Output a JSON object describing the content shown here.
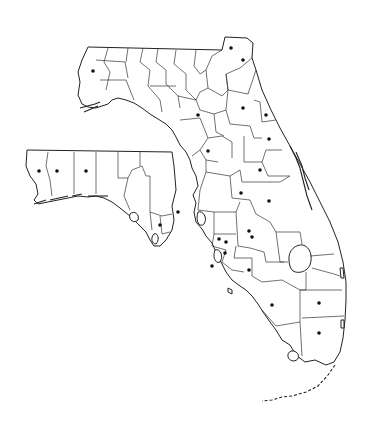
{
  "map": {
    "subject": "Florida county outline map",
    "inset": "Western panhandle inset",
    "line_color": "#222222",
    "background": "#ffffff",
    "marker_color": "#111111",
    "markers_main": [
      [
        93,
        71
      ],
      [
        231,
        48
      ],
      [
        243,
        60
      ],
      [
        198,
        115
      ],
      [
        243,
        108
      ],
      [
        266,
        115
      ],
      [
        208,
        151
      ],
      [
        269,
        139
      ],
      [
        260,
        170
      ],
      [
        241,
        193
      ],
      [
        269,
        201
      ],
      [
        249,
        231
      ],
      [
        226,
        242
      ],
      [
        219,
        239
      ],
      [
        252,
        237
      ],
      [
        225,
        253
      ],
      [
        249,
        270
      ],
      [
        212,
        266
      ],
      [
        272,
        305
      ],
      [
        319,
        303
      ],
      [
        319,
        333
      ],
      [
        178,
        212
      ]
    ],
    "markers_inset": [
      [
        39,
        171
      ],
      [
        57,
        171
      ],
      [
        86,
        171
      ],
      [
        160,
        225
      ]
    ]
  }
}
